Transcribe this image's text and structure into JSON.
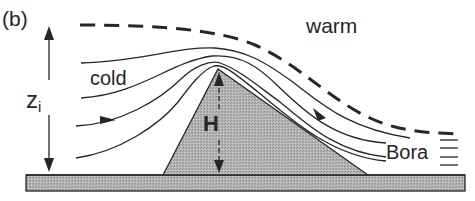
{
  "figure": {
    "panel_label": "(b)",
    "labels": {
      "warm": "warm",
      "cold": "cold",
      "zi_main": "z",
      "zi_sub": "i",
      "mountain_height": "H",
      "bora": "Bora"
    },
    "colors": {
      "line": "#262626",
      "terrain_fill": "#a9a9a9",
      "background": "#ffffff"
    }
  }
}
